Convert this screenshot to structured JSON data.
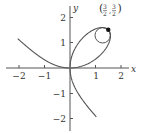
{
  "chart_data": {
    "type": "line",
    "title": "",
    "xlabel": "x",
    "ylabel": "y",
    "xlim": [
      -2.5,
      2.3
    ],
    "ylim": [
      -2.4,
      2.6
    ],
    "grid": false,
    "x_ticks": [
      {
        "value": -2,
        "label": "−2"
      },
      {
        "value": -1,
        "label": "−1"
      },
      {
        "value": 1,
        "label": "1"
      },
      {
        "value": 2,
        "label": "2"
      }
    ],
    "y_ticks": [
      {
        "value": 2,
        "label": "2"
      },
      {
        "value": 1,
        "label": "1"
      },
      {
        "value": -1,
        "label": "−1"
      },
      {
        "value": -2,
        "label": "−2"
      }
    ],
    "series": [
      {
        "name": "Folium of Descartes x^3 + y^3 = 3xy",
        "parametric": {
          "x": "3t/(1+t^3)",
          "y": "3t^2/(1+t^3)"
        },
        "color": "#555555"
      },
      {
        "name": "osculating circle at (3/2, 3/2)",
        "center": [
          1.28,
          1.28
        ],
        "radius": 0.3,
        "color": "#555555"
      }
    ],
    "annotations": [
      {
        "point": [
          1.5,
          1.5
        ],
        "label_num_x": "3",
        "label_den_x": "2",
        "label_num_y": "3",
        "label_den_y": "2",
        "marker": "filled-dot"
      }
    ]
  }
}
